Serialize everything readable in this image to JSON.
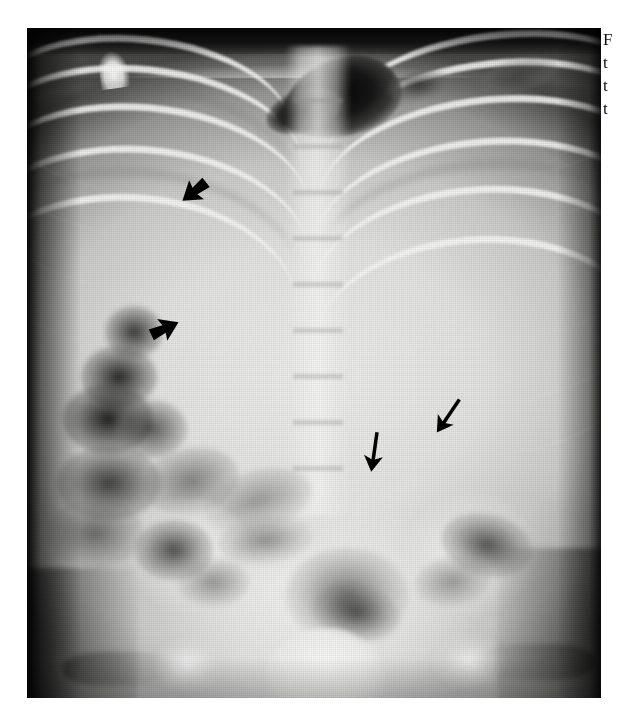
{
  "figure": {
    "kind": "radiograph",
    "modality": "plain-film-x-ray",
    "view": "supine anteroposterior abdomen",
    "plate": {
      "left": 27,
      "top": 28,
      "width": 574,
      "height": 670,
      "border_color": "#0b0b0b",
      "page_background": "#ffffff"
    },
    "regions": [
      {
        "name": "dark-gas-band-upper-left",
        "label": ""
      },
      {
        "name": "gastric-gas-bubble",
        "label": ""
      },
      {
        "name": "lower-rib-cage",
        "label": ""
      },
      {
        "name": "vertebral-column",
        "label": ""
      },
      {
        "name": "bowel-gas-pattern-left-flank",
        "label": ""
      },
      {
        "name": "iliac-wings",
        "label": ""
      },
      {
        "name": "sacrum",
        "label": ""
      },
      {
        "name": "femoral-heads",
        "label": ""
      }
    ]
  },
  "annotations": {
    "arrows": [
      {
        "id": "arrow-thick-upper",
        "style": "solid-thick-arrowhead",
        "direction": "up-left",
        "color": "#000000",
        "x": 176,
        "y": 172,
        "size": 30,
        "rotation": -38
      },
      {
        "id": "arrow-thick-lower",
        "style": "solid-thick-arrowhead",
        "direction": "left",
        "color": "#000000",
        "x": 148,
        "y": 312,
        "size": 30,
        "rotation": -160
      },
      {
        "id": "arrow-thin-center",
        "style": "slim-shafted-arrow",
        "direction": "down",
        "color": "#000000",
        "x": 358,
        "y": 432,
        "size": 40,
        "rotation": 8
      },
      {
        "id": "arrow-thin-right",
        "style": "slim-shafted-arrow",
        "direction": "down-right",
        "color": "#000000",
        "x": 432,
        "y": 398,
        "size": 40,
        "rotation": 36
      }
    ]
  },
  "caption": {
    "clipped": true,
    "lines": [
      "F",
      "t",
      "t",
      "t"
    ],
    "font_size_px": 17,
    "line_height_px": 23,
    "color": "#101010"
  },
  "palette": {
    "page": "#ffffff",
    "plate_border": "#0b0b0b",
    "bone_bright": "#fdfdfc",
    "soft_tissue": "#e8e8e6",
    "gas_dark": "#0a0a0a",
    "annotation": "#000000"
  }
}
